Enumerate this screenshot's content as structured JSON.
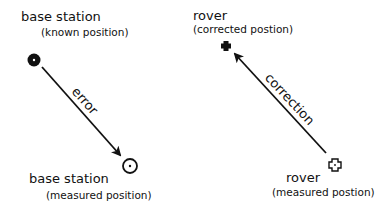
{
  "base_station_known": {
    "title": "base station",
    "subtitle": "(known position)"
  },
  "base_station_measured": {
    "title": "base station",
    "subtitle": "(measured position)"
  },
  "rover_corrected": {
    "title": "rover",
    "subtitle": "(corrected postion)"
  },
  "rover_measured": {
    "title": "rover",
    "subtitle": "(measured postion)"
  },
  "arrows": {
    "error_label": "error",
    "correction_label": "correction"
  },
  "icons": {
    "base_known": "filled-circle-with-dot",
    "base_measured": "open-circle-with-dot",
    "rover_corrected": "filled-cross",
    "rover_measured": "open-cross"
  },
  "colors": {
    "ink": "#111111",
    "background": "#ffffff"
  }
}
